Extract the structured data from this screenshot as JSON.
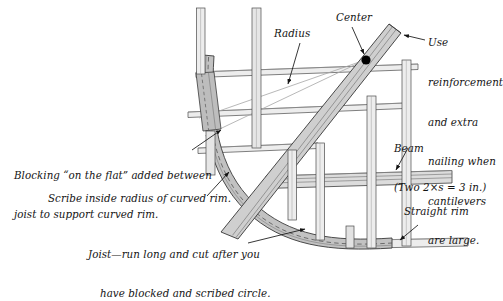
{
  "figure": {
    "style": {
      "paper": "#ffffff",
      "ink": "#141414",
      "lumber_light": "#e3e3e3",
      "lumber_mid": "#c9c9c9",
      "lumber_dark": "#a8a8a8",
      "outline": "#3a3a3a",
      "leader": "#1a1a1a",
      "thin_construction_line": "#8c8c8c",
      "center_dot": "#000000"
    }
  },
  "labels": {
    "radius": "Radius",
    "center": "Center",
    "reinforcement": [
      "Use",
      "reinforcement",
      "and extra",
      "nailing when",
      "cantilevers",
      "are large."
    ],
    "beam": [
      "Beam",
      "(Two 2×s = 3 in.)"
    ],
    "straight_rim": "Straight rim",
    "blocking": [
      "Blocking “on the flat” added between",
      "joist to support curved rim."
    ],
    "scribe": "Scribe inside radius of curved rim.",
    "joist": [
      "Joist—run long and cut after you",
      "have blocked and scribed circle."
    ]
  },
  "parts": {
    "curved_rim": "curved-rim-joist",
    "diagonal_beam": "diagonal-beam",
    "horizontal_beam": "horizontal-beam",
    "straight_rim_board": "straight-rim-board",
    "blocking_piece": "blocking-on-the-flat",
    "center_point": "radius-center-point",
    "radius_line": "radius-layout-line"
  }
}
